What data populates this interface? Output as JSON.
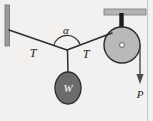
{
  "figure": {
    "kind": "physics-free-body-diagram",
    "canvas": {
      "width": 153,
      "height": 121
    },
    "background_color": "#f2f1ef",
    "border_color": "#cfcdc9"
  },
  "labels": {
    "angle": "α",
    "tension_left": "T",
    "tension_right": "T",
    "weight": "W",
    "applied_force": "P"
  },
  "colors": {
    "line": "#2e2e2e",
    "wall": "#9a9a9a",
    "wall_edge": "#6f6f6f",
    "bracket": "#b4b4b4",
    "bracket_edge": "#7c7c7c",
    "stem": "#1c1c1c",
    "pulley_fill": "#b9b9b9",
    "pulley_edge": "#2a2a2a",
    "hub_fill": "#ffffff",
    "weight_fill": "#6b6b6b",
    "weight_edge": "#2a2a2a",
    "weight_text": "#ffffff",
    "arrow": "#4a4a4a",
    "text": "#1a1a1a"
  },
  "geometry": {
    "wall_post": {
      "x": 7,
      "y_top": 5,
      "y_bottom": 46,
      "width": 4
    },
    "node": {
      "x": 67,
      "y": 50
    },
    "rope_left": {
      "x1": 9,
      "y1": 30,
      "x2": 67,
      "y2": 50
    },
    "rope_right": {
      "x1": 67,
      "y1": 50,
      "x2": 112,
      "y2": 33
    },
    "rope_weight": {
      "x1": 67,
      "y1": 50,
      "x2": 68,
      "y2": 74
    },
    "angle_arc": {
      "cx": 67,
      "cy": 50,
      "radius": 14,
      "label_x": 66,
      "label_y": 31
    },
    "ceiling_bracket": {
      "x": 104,
      "y": 9,
      "width": 42,
      "height": 6
    },
    "pulley_stem": {
      "x": 121,
      "y_top": 13,
      "y_bottom": 45,
      "width": 4
    },
    "pulley": {
      "cx": 122,
      "cy": 45,
      "r": 18
    },
    "pulley_hub": {
      "cx": 122,
      "cy": 45,
      "r": 2.4
    },
    "weight_ellipse": {
      "cx": 68,
      "cy": 88,
      "rx": 13,
      "ry": 16
    },
    "force_arrow": {
      "x": 140,
      "y_top": 46,
      "y_bottom": 84
    },
    "right_border": {
      "x": 147,
      "y_top": 0,
      "y_bottom": 121
    }
  },
  "label_positions": {
    "angle": {
      "x": 66,
      "y": 33
    },
    "tension_left": {
      "x": 33,
      "y": 54
    },
    "tension_right": {
      "x": 86,
      "y": 56
    },
    "weight": {
      "x": 68,
      "y": 92
    },
    "applied_force": {
      "x": 140,
      "y": 97
    }
  }
}
